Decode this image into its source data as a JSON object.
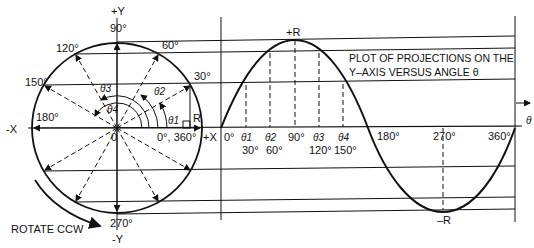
{
  "diagram": {
    "circle_labels": {
      "plus_y": "+Y",
      "minus_y": "-Y",
      "minus_x": "-X",
      "plus_x": "+X",
      "origin": "0",
      "radius": "R",
      "deg_90": "90°",
      "deg_60": "60°",
      "deg_120": "120°",
      "deg_30": "30°",
      "deg_150": "150°",
      "deg_180": "180°",
      "deg_0_360": "0°, 360°",
      "deg_270": "270°",
      "theta1": "θ1",
      "theta2": "θ2",
      "theta3": "θ3",
      "theta4": "θ4"
    },
    "rotate_label": "ROTATE CCW",
    "plot": {
      "title_line1": "PLOT OF PROJECTIONS ON THE",
      "title_line2": "Y–AXIS VERSUS ANGLE θ",
      "peak_label": "+R",
      "trough_label": "–R",
      "axis_label": "θ",
      "ticks": {
        "t0": "0°",
        "t_theta1": "θ1",
        "t_30": "30°",
        "t_theta2": "θ2",
        "t_60": "60°",
        "t_90": "90°",
        "t_theta3": "θ3",
        "t_120": "120°",
        "t_theta4": "θ4",
        "t_150": "150°",
        "t_180": "180°",
        "t_270": "270°",
        "t_360": "360°"
      }
    },
    "colors": {
      "ink": "#111111",
      "background": "#ffffff"
    }
  }
}
